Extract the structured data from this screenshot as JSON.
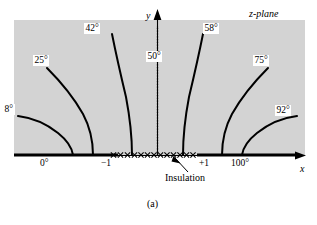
{
  "figure": {
    "plane_label": "z-plane",
    "caption": "(a)",
    "axis": {
      "x_label": "x",
      "y_label": "y"
    },
    "annotation": {
      "insulation": "Insulation"
    },
    "boundary_labels": {
      "left_plate": "0°",
      "right_plate": "100°",
      "left_tick": "−1",
      "right_tick": "+1"
    },
    "isotherm_labels": [
      "8°",
      "25°",
      "42°",
      "50°",
      "58°",
      "75°",
      "92°"
    ],
    "colors": {
      "background": "#ffffff",
      "field": "#d4d4d4",
      "ink": "#000000"
    }
  },
  "chart_data": {
    "type": "line",
    "title": "z-plane",
    "subtitle": "(a)",
    "xlabel": "x",
    "ylabel": "y",
    "grid": false,
    "legend": "none",
    "xlim": [
      -2.6,
      2.6
    ],
    "ylim": [
      0,
      2.1
    ],
    "annotations": [
      {
        "text": "z-plane",
        "x": 2.2,
        "y": 2.0
      },
      {
        "text": "Insulation",
        "x": 0.45,
        "y": -0.45
      },
      {
        "text": "0°",
        "x": -1.75,
        "y": -0.16
      },
      {
        "text": "100°",
        "x": 1.75,
        "y": -0.16
      },
      {
        "text": "−1",
        "x": -1.0,
        "y": -0.18
      },
      {
        "text": "+1",
        "x": 1.0,
        "y": -0.18
      },
      {
        "text": "(a)",
        "x": 0.0,
        "y": -0.85
      }
    ],
    "boundary_conditions": {
      "dirichlet_left": {
        "label": "0°",
        "value": 0,
        "x_range": [
          -2.55,
          -1.0
        ]
      },
      "dirichlet_right": {
        "label": "100°",
        "value": 100,
        "x_range": [
          1.0,
          2.55
        ]
      },
      "neumann_insulated": {
        "label": "Insulation",
        "x_range": [
          -1.0,
          1.0
        ],
        "marker": "x"
      }
    },
    "series": [
      {
        "name": "8°",
        "value": 8,
        "points": [
          [
            -2.1,
            0.62
          ],
          [
            -1.85,
            0.57
          ],
          [
            -1.6,
            0.48
          ],
          [
            -1.4,
            0.37
          ],
          [
            -1.24,
            0.22
          ],
          [
            -1.14,
            0.05
          ],
          [
            -1.1,
            0.0
          ]
        ]
      },
      {
        "name": "25°",
        "value": 25,
        "points": [
          [
            -1.62,
            1.38
          ],
          [
            -1.45,
            1.21
          ],
          [
            -1.28,
            1.01
          ],
          [
            -1.13,
            0.78
          ],
          [
            -1.02,
            0.53
          ],
          [
            -0.96,
            0.27
          ],
          [
            -0.93,
            0.0
          ]
        ]
      },
      {
        "name": "42°",
        "value": 42,
        "points": [
          [
            -0.78,
            1.8
          ],
          [
            -0.71,
            1.52
          ],
          [
            -0.62,
            1.21
          ],
          [
            -0.52,
            0.9
          ],
          [
            -0.45,
            0.6
          ],
          [
            -0.4,
            0.3
          ],
          [
            -0.38,
            0.0
          ]
        ]
      },
      {
        "name": "50°",
        "value": 50,
        "points": [
          [
            0.0,
            1.95
          ],
          [
            0.0,
            1.4
          ],
          [
            0.0,
            0.9
          ],
          [
            0.0,
            0.45
          ],
          [
            0.0,
            0.0
          ]
        ]
      },
      {
        "name": "58°",
        "value": 58,
        "points": [
          [
            0.78,
            1.8
          ],
          [
            0.71,
            1.52
          ],
          [
            0.62,
            1.21
          ],
          [
            0.52,
            0.9
          ],
          [
            0.45,
            0.6
          ],
          [
            0.4,
            0.3
          ],
          [
            0.38,
            0.0
          ]
        ]
      },
      {
        "name": "75°",
        "value": 75,
        "points": [
          [
            1.62,
            1.38
          ],
          [
            1.45,
            1.21
          ],
          [
            1.28,
            1.01
          ],
          [
            1.13,
            0.78
          ],
          [
            1.02,
            0.53
          ],
          [
            0.96,
            0.27
          ],
          [
            0.93,
            0.0
          ]
        ]
      },
      {
        "name": "92°",
        "value": 92,
        "points": [
          [
            2.1,
            0.62
          ],
          [
            1.85,
            0.57
          ],
          [
            1.6,
            0.48
          ],
          [
            1.4,
            0.37
          ],
          [
            1.24,
            0.22
          ],
          [
            1.14,
            0.05
          ],
          [
            1.1,
            0.0
          ]
        ]
      }
    ]
  }
}
